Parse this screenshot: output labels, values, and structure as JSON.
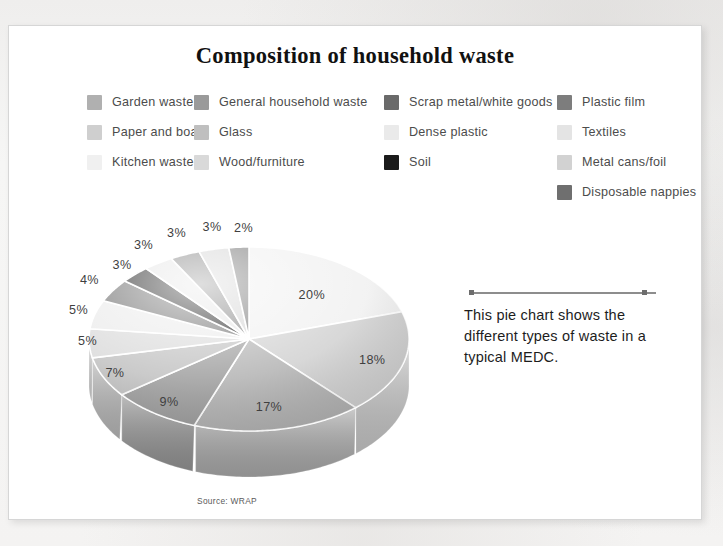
{
  "page": {
    "title": "Composition of household waste",
    "source_note": "Source: WRAP"
  },
  "caption": {
    "text": "This pie chart shows the different types of waste in a typical MEDC."
  },
  "legend": {
    "columns": [
      {
        "items": [
          {
            "label": "Garden waste",
            "color": "#b0b0b0"
          },
          {
            "label": "Paper and board",
            "color": "#cfcfcf"
          },
          {
            "label": "Kitchen waste",
            "color": "#f0f0f0"
          }
        ]
      },
      {
        "items": [
          {
            "label": "General household waste",
            "color": "#9a9a9a"
          },
          {
            "label": "Glass",
            "color": "#bfbfbf"
          },
          {
            "label": "Wood/furniture",
            "color": "#d9d9d9"
          }
        ]
      },
      {
        "items": [
          {
            "label": "Scrap metal/white goods",
            "color": "#6a6a6a"
          },
          {
            "label": "Dense plastic",
            "color": "#eaeaea"
          },
          {
            "label": "Soil",
            "color": "#1a1a1a"
          }
        ]
      },
      {
        "items": [
          {
            "label": "Plastic film",
            "color": "#7d7d7d"
          },
          {
            "label": "Textiles",
            "color": "#e4e4e4"
          },
          {
            "label": "Metal cans/foil",
            "color": "#d2d2d2"
          },
          {
            "label": "Disposable nappies",
            "color": "#6f6f6f"
          }
        ]
      }
    ]
  },
  "chart_data": {
    "type": "pie",
    "title": "Composition of household waste",
    "subtitle": "",
    "xlabel": "",
    "ylabel": "",
    "grid": false,
    "legend_position": "top",
    "value_unit": "percent",
    "source": "Source: WRAP",
    "annotation": "This pie chart shows the different types of waste in a typical MEDC.",
    "labels": [
      "Kitchen waste",
      "Paper and board",
      "Garden waste",
      "General household waste",
      "Glass",
      "Wood/furniture",
      "Dense plastic",
      "Scrap metal/white goods",
      "Soil",
      "Textiles",
      "Plastic film",
      "Metal cans/foil",
      "Disposable nappies"
    ],
    "values": [
      20,
      18,
      17,
      9,
      7,
      5,
      5,
      4,
      3,
      3,
      3,
      3,
      2
    ],
    "value_labels": [
      "20%",
      "18%",
      "17%",
      "9%",
      "7%",
      "5%",
      "5%",
      "4%",
      "3%",
      "3%",
      "3%",
      "3%",
      "2%"
    ],
    "colors": [
      "#f0f0f0",
      "#cfcfcf",
      "#b0b0b0",
      "#9a9a9a",
      "#bfbfbf",
      "#d9d9d9",
      "#eaeaea",
      "#6a6a6a",
      "#1a1a1a",
      "#e4e4e4",
      "#7d7d7d",
      "#d2d2d2",
      "#6f6f6f"
    ]
  }
}
